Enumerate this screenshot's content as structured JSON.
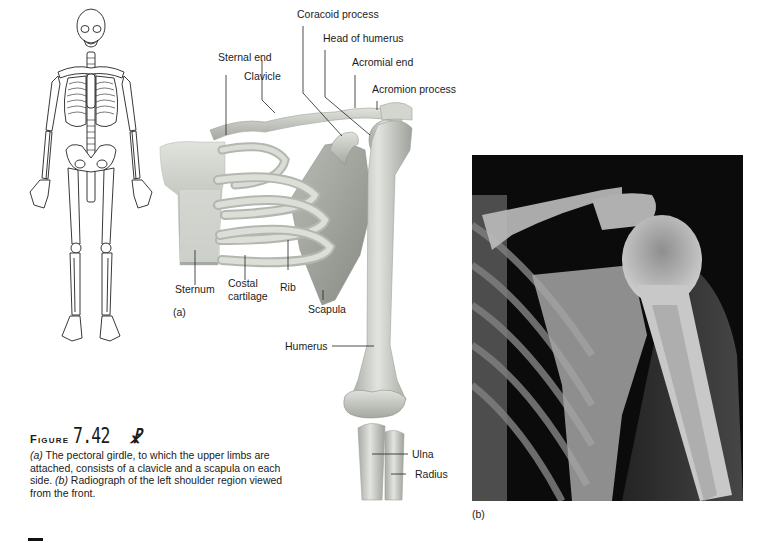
{
  "figure": {
    "label_word": "Figure",
    "number": "7.42",
    "icon": "running-figure-icon",
    "caption": {
      "part_a_marker": "(a)",
      "part_a_text": " The pectoral girdle, to which the upper limbs are attached, consists of a clavicle and a scapula on each side. ",
      "part_b_marker": "(b)",
      "part_b_text": " Radiograph of the left shoulder region viewed from the front."
    }
  },
  "panel_a": {
    "marker": "(a)",
    "labels": {
      "coracoid_process": "Coracoid process",
      "head_of_humerus": "Head of humerus",
      "acromial_end": "Acromial end",
      "acromion_process": "Acromion process",
      "sternal_end": "Sternal end",
      "clavicle": "Clavicle",
      "sternum": "Sternum",
      "costal_cartilage_1": "Costal",
      "costal_cartilage_2": "cartilage",
      "rib": "Rib",
      "scapula": "Scapula",
      "humerus": "Humerus",
      "ulna": "Ulna",
      "radius": "Radius"
    }
  },
  "panel_b": {
    "marker": "(b)",
    "description": "Radiograph of left shoulder"
  },
  "colors": {
    "bone": "#d9dcd6",
    "bone_shadow": "#a9ada6",
    "xray_bg": "#0c0c0c",
    "text": "#1b1b1b"
  }
}
